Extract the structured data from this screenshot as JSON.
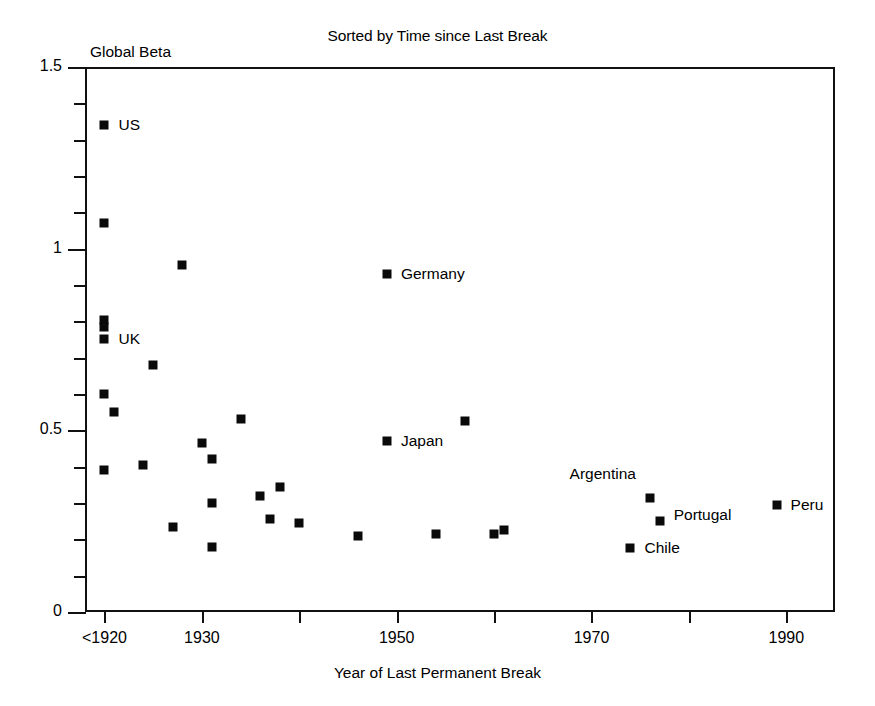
{
  "chart_data": {
    "type": "scatter",
    "title": "Sorted by Time since Last Break",
    "ylabel": "Global Beta",
    "xlabel": "Year of Last Permanent Break",
    "xlim": [
      1918,
      1995
    ],
    "ylim": [
      0,
      1.5
    ],
    "grid": false,
    "legend": "none",
    "y_ticks_major": [
      "0",
      "0.5",
      "1",
      "1.5"
    ],
    "y_ticks_major_values": [
      0,
      0.5,
      1,
      1.5
    ],
    "y_ticks_minor_values": [
      0.1,
      0.2,
      0.3,
      0.4,
      0.6,
      0.7,
      0.8,
      0.9,
      1.1,
      1.2,
      1.3,
      1.4
    ],
    "x_ticks_labels": [
      "<1920",
      "1930",
      "1950",
      "1970",
      "1990"
    ],
    "x_ticks_values": [
      1920,
      1930,
      1950,
      1970,
      1990
    ],
    "x_ticks_minor_values": [
      1940,
      1960,
      1980
    ],
    "marker": "filled-square",
    "marker_color": "#0a0a0a",
    "points": [
      {
        "x": 1920,
        "y": 1.34,
        "label": "US",
        "label_dx": 14,
        "label_dy": 0
      },
      {
        "x": 1920,
        "y": 1.07,
        "label": "",
        "label_dx": 0,
        "label_dy": 0
      },
      {
        "x": 1928,
        "y": 0.955,
        "label": "",
        "label_dx": 0,
        "label_dy": 0
      },
      {
        "x": 1920,
        "y": 0.805,
        "label": "",
        "label_dx": 0,
        "label_dy": 0
      },
      {
        "x": 1920,
        "y": 0.785,
        "label": "",
        "label_dx": 0,
        "label_dy": 0
      },
      {
        "x": 1920,
        "y": 0.752,
        "label": "UK",
        "label_dx": 14,
        "label_dy": 0
      },
      {
        "x": 1925,
        "y": 0.68,
        "label": "",
        "label_dx": 0,
        "label_dy": 0
      },
      {
        "x": 1920,
        "y": 0.6,
        "label": "",
        "label_dx": 0,
        "label_dy": 0
      },
      {
        "x": 1921,
        "y": 0.55,
        "label": "",
        "label_dx": 0,
        "label_dy": 0
      },
      {
        "x": 1934,
        "y": 0.53,
        "label": "",
        "label_dx": 0,
        "label_dy": 0
      },
      {
        "x": 1949,
        "y": 0.93,
        "label": "Germany",
        "label_dx": 14,
        "label_dy": 0
      },
      {
        "x": 1957,
        "y": 0.525,
        "label": "",
        "label_dx": 0,
        "label_dy": 0
      },
      {
        "x": 1949,
        "y": 0.47,
        "label": "Japan",
        "label_dx": 14,
        "label_dy": 0
      },
      {
        "x": 1930,
        "y": 0.465,
        "label": "",
        "label_dx": 0,
        "label_dy": 0
      },
      {
        "x": 1931,
        "y": 0.42,
        "label": "",
        "label_dx": 0,
        "label_dy": 0
      },
      {
        "x": 1924,
        "y": 0.405,
        "label": "",
        "label_dx": 0,
        "label_dy": 0
      },
      {
        "x": 1920,
        "y": 0.39,
        "label": "",
        "label_dx": 0,
        "label_dy": 0
      },
      {
        "x": 1938,
        "y": 0.345,
        "label": "",
        "label_dx": 0,
        "label_dy": 0
      },
      {
        "x": 1936,
        "y": 0.32,
        "label": "",
        "label_dx": 0,
        "label_dy": 0
      },
      {
        "x": 1931,
        "y": 0.3,
        "label": "",
        "label_dx": 0,
        "label_dy": 0
      },
      {
        "x": 1976,
        "y": 0.315,
        "label": "Argentina",
        "label_dx": -14,
        "label_dy": -24,
        "label_anchor": "right"
      },
      {
        "x": 1989,
        "y": 0.295,
        "label": "Peru",
        "label_dx": 14,
        "label_dy": 0
      },
      {
        "x": 1977,
        "y": 0.25,
        "label": "Portugal",
        "label_dx": 14,
        "label_dy": -6
      },
      {
        "x": 1937,
        "y": 0.255,
        "label": "",
        "label_dx": 0,
        "label_dy": 0
      },
      {
        "x": 1940,
        "y": 0.245,
        "label": "",
        "label_dx": 0,
        "label_dy": 0
      },
      {
        "x": 1927,
        "y": 0.235,
        "label": "",
        "label_dx": 0,
        "label_dy": 0
      },
      {
        "x": 1946,
        "y": 0.21,
        "label": "",
        "label_dx": 0,
        "label_dy": 0
      },
      {
        "x": 1954,
        "y": 0.215,
        "label": "",
        "label_dx": 0,
        "label_dy": 0
      },
      {
        "x": 1960,
        "y": 0.215,
        "label": "",
        "label_dx": 0,
        "label_dy": 0
      },
      {
        "x": 1961,
        "y": 0.225,
        "label": "",
        "label_dx": 0,
        "label_dy": 0
      },
      {
        "x": 1974,
        "y": 0.175,
        "label": "Chile",
        "label_dx": 14,
        "label_dy": 0
      },
      {
        "x": 1931,
        "y": 0.18,
        "label": "",
        "label_dx": 0,
        "label_dy": 0
      }
    ]
  }
}
